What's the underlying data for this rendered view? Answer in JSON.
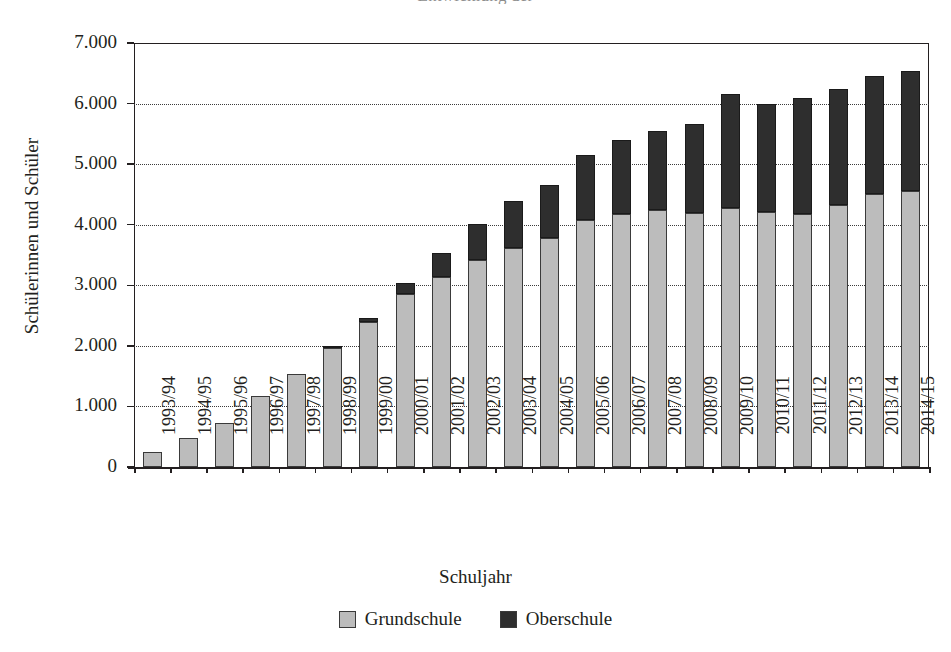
{
  "chart_title_partial": "Entwicklung der",
  "axis": {
    "y_title": "Schülerinnen und Schüler",
    "x_title": "Schuljahr",
    "y_ticks": [
      "0",
      "1.000",
      "2.000",
      "3.000",
      "4.000",
      "5.000",
      "6.000",
      "7.000"
    ]
  },
  "legend": {
    "items": [
      {
        "label": "Grundschule",
        "color": "#bcbcbc",
        "name": "grundschule"
      },
      {
        "label": "Oberschule",
        "color": "#2e2e2e",
        "name": "oberschule"
      }
    ]
  },
  "chart_data": {
    "type": "bar",
    "stacked": true,
    "title": "Entwicklung der",
    "xlabel": "Schuljahr",
    "ylabel": "Schülerinnen und Schüler",
    "ylim": [
      0,
      7000
    ],
    "ytick_step": 1000,
    "grid": true,
    "legend_position": "bottom",
    "categories": [
      "1993/94",
      "1994/95",
      "1995/96",
      "1996/97",
      "1997/98",
      "1998/99",
      "1999/00",
      "2000/01",
      "2001/02",
      "2002/03",
      "2003/04",
      "2004/05",
      "2005/06",
      "2006/07",
      "2007/08",
      "2008/09",
      "2009/10",
      "2010/11",
      "2011/12",
      "2012/13",
      "2013/14",
      "2014/15"
    ],
    "series": [
      {
        "name": "Grundschule",
        "color": "#bcbcbc",
        "values": [
          250,
          480,
          730,
          1180,
          1540,
          1960,
          2390,
          2860,
          3130,
          3410,
          3620,
          3780,
          4080,
          4180,
          4240,
          4200,
          4270,
          4210,
          4170,
          4320,
          4500,
          4560
        ]
      },
      {
        "name": "Oberschule",
        "color": "#2e2e2e",
        "values": [
          0,
          0,
          0,
          0,
          0,
          20,
          70,
          170,
          410,
          600,
          780,
          870,
          1070,
          1220,
          1300,
          1470,
          1890,
          1790,
          1920,
          1920,
          1950,
          1980
        ]
      }
    ],
    "totals": [
      250,
      480,
      730,
      1180,
      1540,
      1980,
      2460,
      3030,
      3540,
      4010,
      4400,
      4650,
      5150,
      5400,
      5540,
      5670,
      6160,
      6000,
      6090,
      6240,
      6450,
      6540
    ]
  }
}
